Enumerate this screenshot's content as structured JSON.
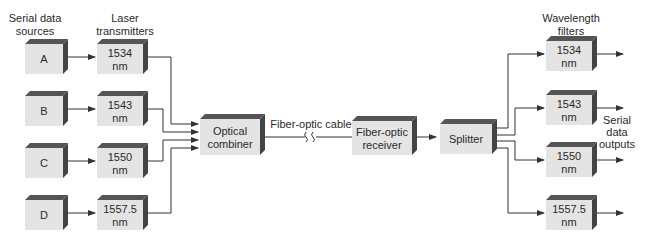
{
  "headings": {
    "sources": [
      "Serial data",
      "sources"
    ],
    "transmitters": [
      "Laser",
      "transmitters"
    ],
    "filters": [
      "Wavelength",
      "filters"
    ],
    "outputs": [
      "Serial",
      "data",
      "outputs"
    ],
    "cable": "Fiber-optic cable"
  },
  "sources": [
    "A",
    "B",
    "C",
    "D"
  ],
  "transmitters": [
    [
      "1534",
      "nm"
    ],
    [
      "1543",
      "nm"
    ],
    [
      "1550",
      "nm"
    ],
    [
      "1557.5",
      "nm"
    ]
  ],
  "combiner": [
    "Optical",
    "combiner"
  ],
  "receiver": [
    "Fiber-optic",
    "receiver"
  ],
  "splitter": [
    "Splitter"
  ],
  "filters": [
    [
      "1534",
      "nm"
    ],
    [
      "1543",
      "nm"
    ],
    [
      "1550",
      "nm"
    ],
    [
      "1557.5",
      "nm"
    ]
  ],
  "colors": {
    "face": "#e4e4e4",
    "shade": "#4a4a4a",
    "line": "#333333",
    "text": "#2a2a2a"
  }
}
